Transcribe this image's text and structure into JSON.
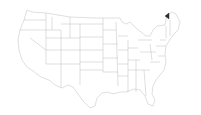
{
  "map": {
    "title": "",
    "region": "Contiguous United States",
    "style": {
      "state_fill": "#ffffff",
      "state_stroke": "#b8b8b8",
      "highlight_fill": "#2b2b2b",
      "background": "#ffffff"
    },
    "highlighted": [
      {
        "name": "Vermont (northern)",
        "marker": "filled-triangle"
      }
    ]
  }
}
